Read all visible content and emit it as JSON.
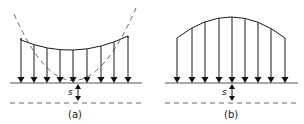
{
  "panels": [
    {
      "id": "a",
      "caption": "(a)",
      "settlement_label": "s",
      "profile": "concave",
      "arrow_count": 9
    },
    {
      "id": "b",
      "caption": "(b)",
      "settlement_label": "s",
      "profile": "convex",
      "arrow_count": 9
    }
  ],
  "colors": {
    "stroke": "#1a1a1a",
    "baseline": "#555555"
  }
}
